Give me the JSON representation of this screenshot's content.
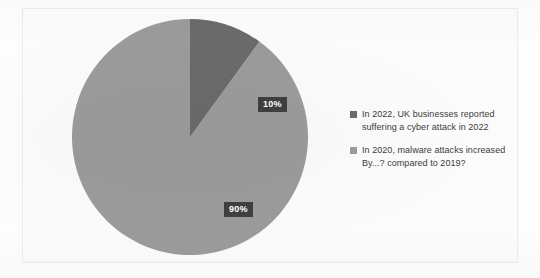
{
  "chart_data": {
    "type": "pie",
    "title": "",
    "categories": [
      "In 2022, UK businesses reported suffering a cyber attack in 2022",
      "In 2020, malware attacks increased By...? compared to 2019?"
    ],
    "values": [
      10,
      90
    ],
    "value_labels": [
      "10%",
      "90%"
    ],
    "colors": [
      "#6a6a6a",
      "#9b9b9b"
    ],
    "legend_position": "right",
    "start_angle_deg": 0,
    "direction": "clockwise",
    "grid": false,
    "xlabel": "",
    "ylabel": ""
  },
  "slices": [
    {
      "name": "cyber-attack-2022",
      "label": "10%",
      "value": 10,
      "color": "#6a6a6a"
    },
    {
      "name": "malware-increase-2020",
      "label": "90%",
      "value": 90,
      "color": "#9b9b9b"
    }
  ],
  "legend": {
    "items": [
      {
        "swatch_color": "#6a6a6a",
        "line1": "In 2022, UK businesses reported",
        "line2": "suffering a cyber attack in 2022"
      },
      {
        "swatch_color": "#9b9b9b",
        "line1": "In 2020, malware attacks increased",
        "line2": "By...? compared to 2019?"
      }
    ]
  }
}
